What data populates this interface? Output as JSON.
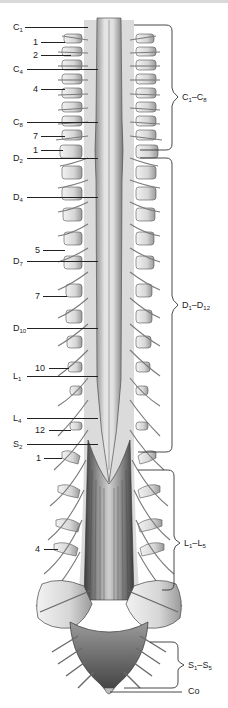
{
  "figure": {
    "background": "#ffffff",
    "ink_color": "#222222"
  },
  "left_labels": [
    {
      "base": "C",
      "sub": "1",
      "y": 22,
      "line_to": 88
    },
    {
      "base": "1",
      "sub": "",
      "y": 37,
      "line_to": 70
    },
    {
      "base": "2",
      "sub": "",
      "y": 50,
      "line_to": 76
    },
    {
      "base": "C",
      "sub": "4",
      "y": 64,
      "line_to": 96
    },
    {
      "base": "4",
      "sub": "",
      "y": 84,
      "line_to": 70
    },
    {
      "base": "C",
      "sub": "8",
      "y": 117,
      "line_to": 97
    },
    {
      "base": "7",
      "sub": "",
      "y": 131,
      "line_to": 70
    },
    {
      "base": "1",
      "sub": "",
      "y": 145,
      "line_to": 68
    },
    {
      "base": "D",
      "sub": "2",
      "y": 153,
      "line_to": 98
    },
    {
      "base": "5",
      "sub": "",
      "y": 245,
      "line_to": 68
    },
    {
      "base": "D",
      "sub": "4",
      "y": 192,
      "line_to": 98
    },
    {
      "base": "D",
      "sub": "7",
      "y": 256,
      "line_to": 98
    },
    {
      "base": "7",
      "sub": "",
      "y": 291,
      "line_to": 68
    },
    {
      "base": "D",
      "sub": "10",
      "y": 323,
      "line_to": 98
    },
    {
      "base": "10",
      "sub": "",
      "y": 363,
      "line_to": 70
    },
    {
      "base": "L",
      "sub": "1",
      "y": 371,
      "line_to": 98
    },
    {
      "base": "L",
      "sub": "4",
      "y": 413,
      "line_to": 98
    },
    {
      "base": "12",
      "sub": "",
      "y": 425,
      "line_to": 72
    },
    {
      "base": "S",
      "sub": "2",
      "y": 439,
      "line_to": 98
    },
    {
      "base": "1",
      "sub": "",
      "y": 453,
      "line_to": 62
    },
    {
      "base": "4",
      "sub": "",
      "y": 544,
      "line_to": 58
    }
  ],
  "right_ranges": [
    {
      "from_base": "C",
      "from_sub": "1",
      "to_base": "C",
      "to_sub": "8",
      "top": 25,
      "bottom": 150,
      "label_y": 92
    },
    {
      "from_base": "D",
      "from_sub": "1",
      "to_base": "D",
      "to_sub": "12",
      "top": 158,
      "bottom": 452,
      "label_y": 300
    },
    {
      "from_base": "L",
      "from_sub": "1",
      "to_base": "L",
      "to_sub": "5",
      "top": 470,
      "bottom": 590,
      "label_y": 538
    },
    {
      "from_base": "S",
      "from_sub": "1",
      "to_base": "S",
      "to_sub": "5",
      "top": 642,
      "bottom": 688,
      "label_y": 660
    }
  ],
  "coccygeal": {
    "label": "Co",
    "y": 692
  },
  "range_dash": "–"
}
